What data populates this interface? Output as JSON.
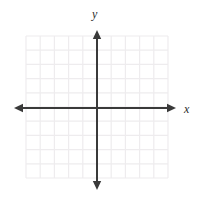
{
  "figure": {
    "kind": "coordinate-plane",
    "width": 204,
    "height": 202,
    "background_color": "#ffffff",
    "title": ""
  },
  "axis_labels": {
    "x": "x",
    "y": "y"
  },
  "chart_data": {
    "type": "scatter",
    "title": "",
    "subtitle": "",
    "xlabel": "x",
    "ylabel": "y",
    "x": [],
    "y": [],
    "series": [],
    "annotations": [],
    "legend": null,
    "legend_position": "none",
    "grid": true,
    "grid_color": "#eeecee",
    "grid_cells_x": 10,
    "grid_cells_y": 10,
    "tick_labels_x": [],
    "tick_labels_y": [],
    "xlim": [
      -5,
      5
    ],
    "ylim": [
      -5,
      5
    ],
    "origin_px": {
      "x": 97,
      "y": 108
    },
    "cell_size_px": 14.2,
    "axis_color": "#3a3a3a",
    "axis_arrows": [
      "left",
      "right",
      "up",
      "down"
    ],
    "grid_bounds_px": {
      "left": 26,
      "top": 36,
      "right": 168,
      "bottom": 178
    },
    "x_axis_px": {
      "y": 108,
      "from": 14,
      "to": 176
    },
    "y_axis_px": {
      "x": 97,
      "from": 30,
      "to": 190
    }
  }
}
